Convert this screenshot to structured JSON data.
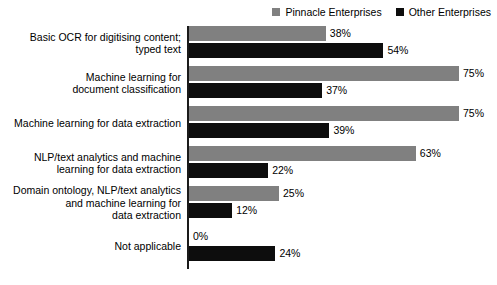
{
  "chart_data": {
    "type": "bar",
    "orientation": "horizontal",
    "title": "",
    "xlabel": "",
    "ylabel": "",
    "xlim": [
      0,
      80
    ],
    "grid": false,
    "legend_position": "top-right",
    "value_suffix": "%",
    "categories": [
      "Basic OCR for digitising content;\ntyped text",
      "Machine learning for\ndocument classification",
      "Machine learning for data extraction",
      "NLP/text analytics and machine\nlearning for data extraction",
      "Domain ontology, NLP/text analytics\nand machine learning for\ndata extraction",
      "Not applicable"
    ],
    "series": [
      {
        "name": "Pinnacle Enterprises",
        "color": "#808080",
        "values": [
          38,
          75,
          75,
          63,
          25,
          0
        ],
        "labels": [
          "38%",
          "75%",
          "75%",
          "63%",
          "25%",
          "0%"
        ]
      },
      {
        "name": "Other Enterprises",
        "color": "#0d0d0d",
        "values": [
          54,
          37,
          39,
          22,
          12,
          24
        ],
        "labels": [
          "54%",
          "37%",
          "39%",
          "22%",
          "12%",
          "24%"
        ]
      }
    ]
  },
  "legend": {
    "items": [
      {
        "label": "Pinnacle Enterprises",
        "color": "#808080"
      },
      {
        "label": "Other Enterprises",
        "color": "#0d0d0d"
      }
    ]
  }
}
